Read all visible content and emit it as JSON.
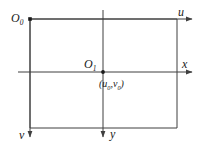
{
  "figure": {
    "name": "image-plane-coordinate-frames",
    "stroke_color": "#3f3f3f",
    "text_color": "#1a1a1a",
    "background": "#ffffff",
    "labels": {
      "origin_pixel": {
        "base": "O",
        "sub": "0"
      },
      "axis_u": "u",
      "axis_v": "v",
      "origin_image": {
        "base": "O",
        "sub": "1"
      },
      "axis_x": "x",
      "axis_y": "y",
      "principal_point": {
        "open": "(",
        "u_base": "u",
        "u_sub": "0",
        "comma": ",",
        "v_base": "v",
        "v_sub": "0",
        "close": ")"
      }
    },
    "geometry": {
      "rectangle": {
        "x": 30,
        "y": 19,
        "width": 147,
        "height": 109
      },
      "pixel_origin_dot": {
        "x": 30,
        "y": 19
      },
      "image_origin_dot": {
        "x": 103,
        "y": 72
      },
      "u_axis": {
        "from_x": 30,
        "to_x": 199,
        "y": 19,
        "arrow": "right"
      },
      "v_axis": {
        "x": 30,
        "from_y": 19,
        "to_y": 143,
        "arrow": "down"
      },
      "x_axis": {
        "from_x": 18,
        "to_x": 199,
        "y": 72,
        "arrow": "right"
      },
      "y_axis": {
        "x": 103,
        "from_y": 10,
        "to_y": 143,
        "arrow": "down"
      }
    }
  }
}
